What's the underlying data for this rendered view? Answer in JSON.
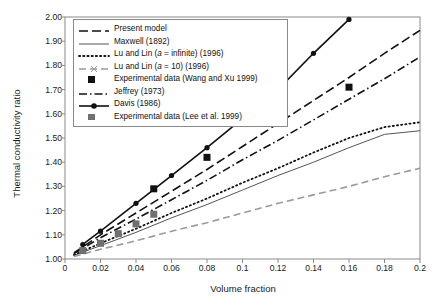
{
  "chart_data": {
    "type": "line",
    "title": "",
    "xlabel": "Volume fraction",
    "ylabel": "Thermal conductivity ratio",
    "xlim": [
      0,
      0.2
    ],
    "ylim": [
      1.0,
      2.0
    ],
    "xticks": [
      "0",
      "0.02",
      "0.04",
      "0.06",
      "0.08",
      "0.1",
      "0.12",
      "0.14",
      "0.16",
      "0.18",
      "0.2"
    ],
    "xtick_values": [
      0,
      0.02,
      0.04,
      0.06,
      0.08,
      0.1,
      0.12,
      0.14,
      0.16,
      0.18,
      0.2
    ],
    "yticks": [
      "1.00",
      "1.10",
      "1.20",
      "1.30",
      "1.40",
      "1.50",
      "1.60",
      "1.70",
      "1.80",
      "1.90",
      "2.00"
    ],
    "ytick_values": [
      1.0,
      1.1,
      1.2,
      1.3,
      1.4,
      1.5,
      1.6,
      1.7,
      1.8,
      1.9,
      2.0
    ],
    "grid": false,
    "legend_position": "upper-left",
    "series": [
      {
        "name": "Present model",
        "style": "dashed-long",
        "color": "#111111",
        "x": [
          0.005,
          0.02,
          0.04,
          0.06,
          0.08,
          0.1,
          0.12,
          0.14,
          0.16,
          0.18,
          0.2
        ],
        "values": [
          1.025,
          1.1,
          1.19,
          1.28,
          1.37,
          1.465,
          1.56,
          1.655,
          1.75,
          1.85,
          1.945
        ]
      },
      {
        "name": "Maxwell (1892)",
        "style": "solid",
        "color": "#555555",
        "x": [
          0.005,
          0.02,
          0.04,
          0.06,
          0.08,
          0.1,
          0.12,
          0.14,
          0.16,
          0.18,
          0.2
        ],
        "values": [
          1.015,
          1.055,
          1.11,
          1.17,
          1.225,
          1.285,
          1.345,
          1.4,
          1.46,
          1.515,
          1.53
        ]
      },
      {
        "name": "Lu and Lin (a = infinite) (1996)",
        "style": "dotted",
        "color": "#111111",
        "x": [
          0.005,
          0.02,
          0.04,
          0.06,
          0.08,
          0.1,
          0.12,
          0.14,
          0.16,
          0.18,
          0.2
        ],
        "values": [
          1.017,
          1.065,
          1.125,
          1.19,
          1.25,
          1.315,
          1.375,
          1.44,
          1.5,
          1.545,
          1.565
        ]
      },
      {
        "name": "Lu and Lin (a = 10) (1996)",
        "style": "dash-x-gray",
        "color": "#9a9a9a",
        "x": [
          0.005,
          0.02,
          0.04,
          0.06,
          0.08,
          0.1,
          0.12,
          0.14,
          0.16,
          0.18,
          0.2
        ],
        "values": [
          1.01,
          1.04,
          1.075,
          1.115,
          1.15,
          1.19,
          1.23,
          1.265,
          1.3,
          1.34,
          1.375
        ]
      },
      {
        "name": "Jeffrey (1973)",
        "style": "dash-dot",
        "color": "#111111",
        "x": [
          0.005,
          0.02,
          0.04,
          0.06,
          0.08,
          0.1,
          0.12,
          0.14,
          0.16,
          0.18,
          0.2
        ],
        "values": [
          1.022,
          1.088,
          1.165,
          1.245,
          1.325,
          1.41,
          1.49,
          1.575,
          1.66,
          1.745,
          1.835
        ]
      },
      {
        "name": "Davis (1986)",
        "style": "solid-marker",
        "color": "#111111",
        "x": [
          0.01,
          0.02,
          0.04,
          0.06,
          0.08,
          0.1,
          0.12,
          0.14,
          0.16
        ],
        "values": [
          1.06,
          1.115,
          1.23,
          1.345,
          1.46,
          1.58,
          1.7,
          1.85,
          1.99
        ]
      }
    ],
    "scatter_series": [
      {
        "name": "Experimental data (Wang and Xu 1999)",
        "marker": "square",
        "color": "#111111",
        "x": [
          0.05,
          0.08,
          0.16
        ],
        "values": [
          1.29,
          1.42,
          1.71
        ]
      },
      {
        "name": "Experimental data (Lee et al. 1999)",
        "marker": "square",
        "color": "#707070",
        "x": [
          0.01,
          0.02,
          0.03,
          0.04,
          0.05
        ],
        "values": [
          1.035,
          1.065,
          1.105,
          1.145,
          1.185
        ]
      }
    ]
  },
  "legend": {
    "items": [
      {
        "label": "Present model",
        "kind": "line"
      },
      {
        "label": "Maxwell (1892)",
        "kind": "line"
      },
      {
        "label_pre": "Lu and Lin (",
        "label_italic": "a",
        "label_post": " = infinite) (1996)",
        "kind": "line"
      },
      {
        "label_pre": "Lu and Lin (",
        "label_italic": "a",
        "label_post": " = 10) (1996)",
        "kind": "line"
      },
      {
        "label": "Experimental data (Wang and Xu 1999)",
        "kind": "marker-black"
      },
      {
        "label": "Jeffrey (1973)",
        "kind": "line"
      },
      {
        "label": "Davis (1986)",
        "kind": "line-marker"
      },
      {
        "label": "Experimental data (Lee et al. 1999)",
        "kind": "marker-gray"
      }
    ]
  }
}
